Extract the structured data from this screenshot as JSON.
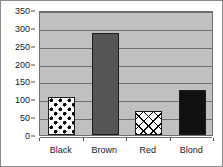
{
  "chart_data": {
    "type": "bar",
    "title": "",
    "subtitle": "",
    "xlabel": "",
    "ylabel": "",
    "categories": [
      "Black",
      "Brown",
      "Red",
      "Blond"
    ],
    "values": [
      105,
      285,
      67,
      125
    ],
    "series": [
      {
        "name": "",
        "values": [
          105,
          285,
          67,
          125
        ]
      }
    ],
    "ylim": [
      0,
      350
    ],
    "ytick_values": [
      0,
      50,
      100,
      150,
      200,
      250,
      300,
      350
    ],
    "ytick_labels": [
      "0",
      "50",
      "100",
      "150",
      "200",
      "250",
      "300",
      "350"
    ],
    "grid": true,
    "legend": false,
    "legend_position": "none",
    "annotations": [],
    "bar_styles": [
      {
        "category": "Black",
        "fill": "polka-dots",
        "fill_color": "#000000",
        "background_color": "#ffffff"
      },
      {
        "category": "Brown",
        "fill": "solid",
        "fill_color": "#555555",
        "background_color": "#555555"
      },
      {
        "category": "Red",
        "fill": "diagonal-crosshatch",
        "fill_color": "#000000",
        "background_color": "#ffffff"
      },
      {
        "category": "Blond",
        "fill": "solid",
        "fill_color": "#111111",
        "background_color": "#111111"
      }
    ],
    "colors": {
      "plot_background": "#c0c0c0",
      "canvas_background": "#ffffff",
      "gridline": "#6e6e6e",
      "axis_text": "#1a1a1a",
      "border": "#8a8a8a"
    }
  }
}
